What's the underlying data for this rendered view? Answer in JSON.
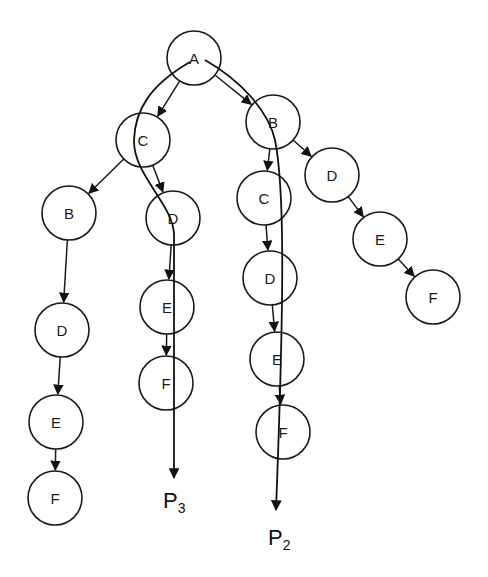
{
  "diagram": {
    "type": "tree",
    "node_radius": 27,
    "nodes": [
      {
        "id": "A",
        "label": "A",
        "x": 194,
        "y": 58
      },
      {
        "id": "C1",
        "label": "C",
        "x": 143,
        "y": 140
      },
      {
        "id": "B1",
        "label": "B",
        "x": 273,
        "y": 122
      },
      {
        "id": "B2",
        "label": "B",
        "x": 69,
        "y": 213
      },
      {
        "id": "D2",
        "label": "D",
        "x": 173,
        "y": 218
      },
      {
        "id": "C3",
        "label": "C",
        "x": 264,
        "y": 198
      },
      {
        "id": "D3",
        "label": "D",
        "x": 332,
        "y": 175
      },
      {
        "id": "D4",
        "label": "D",
        "x": 62,
        "y": 330
      },
      {
        "id": "E2",
        "label": "E",
        "x": 167,
        "y": 307
      },
      {
        "id": "D5",
        "label": "D",
        "x": 270,
        "y": 278
      },
      {
        "id": "E3",
        "label": "E",
        "x": 380,
        "y": 239
      },
      {
        "id": "E4",
        "label": "E",
        "x": 56,
        "y": 422
      },
      {
        "id": "F2",
        "label": "F",
        "x": 166,
        "y": 383
      },
      {
        "id": "E5",
        "label": "E",
        "x": 277,
        "y": 359
      },
      {
        "id": "F3",
        "label": "F",
        "x": 433,
        "y": 297
      },
      {
        "id": "F4",
        "label": "F",
        "x": 55,
        "y": 498
      },
      {
        "id": "F5",
        "label": "F",
        "x": 283,
        "y": 432
      }
    ],
    "edges": [
      [
        "A",
        "C1"
      ],
      [
        "A",
        "B1"
      ],
      [
        "C1",
        "B2"
      ],
      [
        "C1",
        "D2"
      ],
      [
        "B1",
        "C3"
      ],
      [
        "B1",
        "D3"
      ],
      [
        "B2",
        "D4"
      ],
      [
        "D4",
        "E4"
      ],
      [
        "E4",
        "F4"
      ],
      [
        "D2",
        "E2"
      ],
      [
        "E2",
        "F2"
      ],
      [
        "C3",
        "D5"
      ],
      [
        "D5",
        "E5"
      ],
      [
        "E5",
        "F5"
      ],
      [
        "D3",
        "E3"
      ],
      [
        "E3",
        "F3"
      ]
    ],
    "paths": [
      {
        "name": "P3",
        "label_main": "P",
        "label_sub": "3",
        "label_x": 163,
        "label_y": 508,
        "d": "M 190 62 C 150 85, 135 110, 134 140 C 133 175, 174 205, 174 235 L 174 478"
      },
      {
        "name": "P2",
        "label_main": "P",
        "label_sub": "2",
        "label_x": 268,
        "label_y": 545,
        "d": "M 205 60 C 240 80, 268 110, 275 140 C 285 190, 284 300, 276 510"
      }
    ]
  }
}
